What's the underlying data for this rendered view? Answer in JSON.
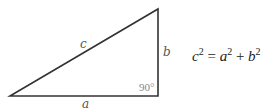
{
  "diagram": {
    "type": "right-triangle",
    "vertices": {
      "left": [
        10,
        96
      ],
      "right_angle": [
        158,
        96
      ],
      "top": [
        158,
        9
      ]
    },
    "line_color": "#333333",
    "labels": {
      "hypotenuse": "c",
      "base": "a",
      "height": "b",
      "angle": "90°"
    }
  },
  "equation": {
    "lhs_var": "c",
    "lhs_exp": "2",
    "equals": "=",
    "term1_var": "a",
    "term1_exp": "2",
    "plus": "+",
    "term2_var": "b",
    "term2_exp": "2"
  }
}
